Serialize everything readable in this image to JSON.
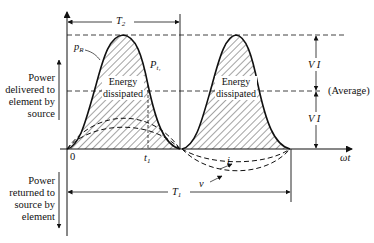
{
  "diagram": {
    "type": "power waveform",
    "axes": {
      "horizontal_label": "ωt",
      "origin_label": "0",
      "t1_label": "t",
      "t1_sub": "1"
    },
    "side_labels": {
      "delivered": [
        "Power",
        "delivered to",
        "element by",
        "source"
      ],
      "returned": [
        "Power",
        "returned to",
        "source by",
        "element"
      ]
    },
    "curve_labels": {
      "pR": "p",
      "pR_sub": "R",
      "pt1": "P",
      "pt1_sub": "t₁",
      "i": "i",
      "v": "v"
    },
    "pulses": [
      {
        "line1": "Energy",
        "line2": "dissipated"
      },
      {
        "line1": "Energy",
        "line2": "dissipated"
      }
    ],
    "dimensions": {
      "T2": "T",
      "T2_sub": "2",
      "T1": "T",
      "T1_sub": "1",
      "VI_upper": "V I",
      "VI_lower": "V I",
      "average": "(Average)"
    },
    "colors": {
      "line": "#111111",
      "background": "#ffffff"
    }
  }
}
